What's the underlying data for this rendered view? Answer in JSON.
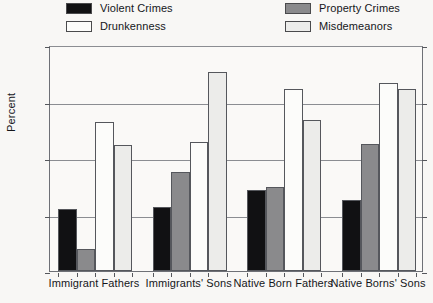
{
  "chart_data": {
    "type": "bar",
    "title": "",
    "xlabel": "",
    "ylabel": "Percent",
    "ylim": [
      0,
      40
    ],
    "yticks": [
      0,
      10,
      20,
      30,
      40
    ],
    "grid": true,
    "legend_position": "top",
    "categories": [
      "Immigrant Fathers",
      "Immigrants' Sons",
      "Native Born Fathers",
      "Native Borns' Sons"
    ],
    "series": [
      {
        "name": "Violent Crimes",
        "color": "#111113",
        "values": [
          10.9,
          11.3,
          14.4,
          12.6
        ]
      },
      {
        "name": "Property Crimes",
        "color": "#8a8a8c",
        "values": [
          3.9,
          17.6,
          14.9,
          22.4
        ]
      },
      {
        "name": "Drunkenness",
        "color": "#fcfcfa",
        "values": [
          26.4,
          22.9,
          32.3,
          33.2
        ]
      },
      {
        "name": "Misdemeanors",
        "color": "#ececea",
        "values": [
          22.3,
          35.2,
          26.7,
          32.3
        ]
      }
    ]
  },
  "axis": {
    "tick_labels": [
      "40",
      "30",
      "20",
      "10",
      "0"
    ],
    "y_title": "Percent"
  },
  "legend": {
    "entries": [
      {
        "label": "Violent Crimes",
        "swatch": "#111113"
      },
      {
        "label": "Property Crimes",
        "swatch": "#8a8a8c"
      },
      {
        "label": "Drunkenness",
        "swatch": "#fcfcfa"
      },
      {
        "label": "Misdemeanors",
        "swatch": "#ececea"
      }
    ]
  }
}
